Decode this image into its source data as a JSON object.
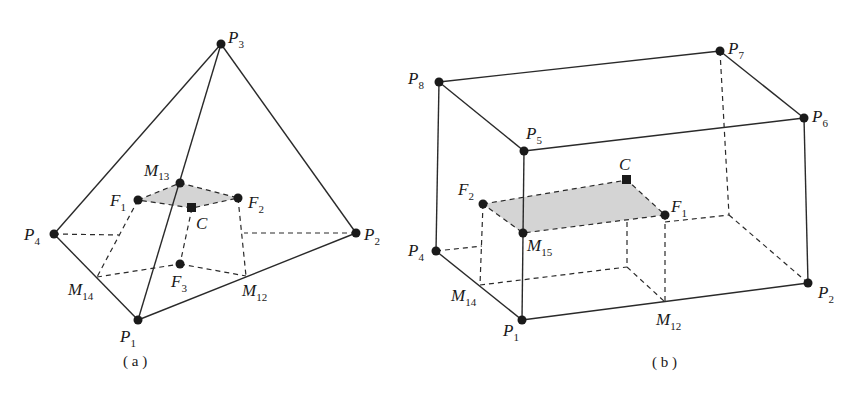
{
  "figure": {
    "panels": [
      {
        "id": "a",
        "caption": "( a )",
        "shape": "tetrahedron",
        "vertices": {
          "P1": {
            "x": 138,
            "y": 320,
            "name": "P",
            "sub": "1"
          },
          "P2": {
            "x": 356,
            "y": 233,
            "name": "P",
            "sub": "2"
          },
          "P3": {
            "x": 221,
            "y": 44,
            "name": "P",
            "sub": "3"
          },
          "P4": {
            "x": 54,
            "y": 234,
            "name": "P",
            "sub": "4"
          }
        },
        "points": {
          "M13": {
            "x": 180,
            "y": 183,
            "name": "M",
            "sub": "13"
          },
          "F1": {
            "x": 138,
            "y": 200,
            "name": "F",
            "sub": "1"
          },
          "F2": {
            "x": 238,
            "y": 198,
            "name": "F",
            "sub": "2"
          },
          "F3": {
            "x": 180,
            "y": 264,
            "name": "F",
            "sub": "3"
          },
          "M14": {
            "x": 97,
            "y": 277,
            "name": "M",
            "sub": "14"
          },
          "M12": {
            "x": 246,
            "y": 276,
            "name": "M",
            "sub": "12"
          },
          "C": {
            "x": 192,
            "y": 208,
            "name": "C",
            "sub": ""
          }
        }
      },
      {
        "id": "b",
        "caption": "( b )",
        "shape": "hexahedron",
        "vertices": {
          "P1": {
            "x": 522,
            "y": 320,
            "name": "P",
            "sub": "1"
          },
          "P2": {
            "x": 808,
            "y": 283,
            "name": "P",
            "sub": "2"
          },
          "P4": {
            "x": 436,
            "y": 251,
            "name": "P",
            "sub": "4"
          },
          "P5": {
            "x": 524,
            "y": 151,
            "name": "P",
            "sub": "5"
          },
          "P6": {
            "x": 804,
            "y": 118,
            "name": "P",
            "sub": "6"
          },
          "P7": {
            "x": 720,
            "y": 51,
            "name": "P",
            "sub": "7"
          },
          "P8": {
            "x": 439,
            "y": 82,
            "name": "P",
            "sub": "8"
          }
        },
        "points": {
          "F1": {
            "x": 665,
            "y": 215,
            "name": "F",
            "sub": "1"
          },
          "F2": {
            "x": 483,
            "y": 204,
            "name": "F",
            "sub": "2"
          },
          "M15": {
            "x": 523,
            "y": 233,
            "name": "M",
            "sub": "15"
          },
          "M14": {
            "x": 480,
            "y": 285,
            "name": "M",
            "sub": "14"
          },
          "M12": {
            "x": 665,
            "y": 302,
            "name": "M",
            "sub": "12"
          },
          "C": {
            "x": 627,
            "y": 180,
            "name": "C",
            "sub": ""
          }
        }
      }
    ]
  },
  "labels": {
    "a": {
      "P3": {
        "main": "P",
        "sub": "3"
      },
      "P4": {
        "main": "P",
        "sub": "4"
      },
      "P2": {
        "main": "P",
        "sub": "2"
      },
      "P1": {
        "main": "P",
        "sub": "1"
      },
      "M13": {
        "main": "M",
        "sub": "13"
      },
      "F1": {
        "main": "F",
        "sub": "1"
      },
      "F2": {
        "main": "F",
        "sub": "2"
      },
      "F3": {
        "main": "F",
        "sub": "3"
      },
      "M14": {
        "main": "M",
        "sub": "14"
      },
      "M12": {
        "main": "M",
        "sub": "12"
      },
      "C": {
        "main": "C"
      },
      "caption": "( a )"
    },
    "b": {
      "P8": {
        "main": "P",
        "sub": "8"
      },
      "P7": {
        "main": "P",
        "sub": "7"
      },
      "P6": {
        "main": "P",
        "sub": "6"
      },
      "P5": {
        "main": "P",
        "sub": "5"
      },
      "P4": {
        "main": "P",
        "sub": "4"
      },
      "P2": {
        "main": "P",
        "sub": "2"
      },
      "P1": {
        "main": "P",
        "sub": "1"
      },
      "F1": {
        "main": "F",
        "sub": "1"
      },
      "F2": {
        "main": "F",
        "sub": "2"
      },
      "M15": {
        "main": "M",
        "sub": "15"
      },
      "M14": {
        "main": "M",
        "sub": "14"
      },
      "M12": {
        "main": "M",
        "sub": "12"
      },
      "C": {
        "main": "C"
      },
      "caption": "( b )"
    }
  }
}
